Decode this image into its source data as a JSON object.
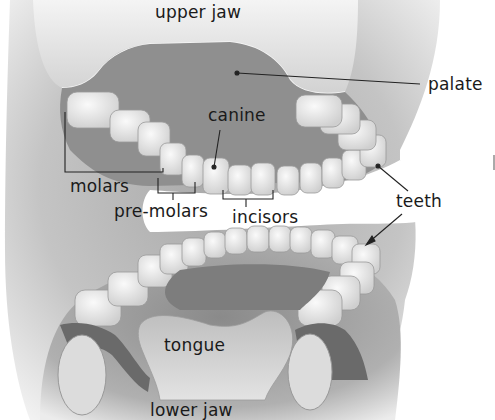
{
  "diagram": {
    "type": "anatomical-illustration",
    "labels": {
      "upper_jaw": "upper jaw",
      "palate": "palate",
      "canine": "canine",
      "molars": "molars",
      "pre_molars": "pre-molars",
      "incisors": "incisors",
      "teeth": "teeth",
      "tongue": "tongue",
      "lower_jaw": "lower jaw"
    },
    "colors": {
      "background": "#ffffff",
      "jaw_skin": "#d9d9d9",
      "mouth_interior": "#8c8c8c",
      "tooth": "#eeeeee",
      "tongue": "#c8c8c8",
      "gum": "#6f6f6f",
      "leader_line": "#222222",
      "text": "#1a1a1a"
    }
  }
}
